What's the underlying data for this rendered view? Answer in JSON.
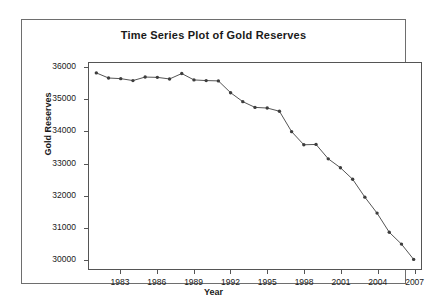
{
  "chart_data": {
    "type": "line",
    "title": "Time Series Plot of Gold Reserves",
    "xlabel": "Year",
    "ylabel": "Gold Reserves",
    "xlim": [
      1980.4,
      2007.6
    ],
    "ylim": [
      29700,
      36150
    ],
    "grid": false,
    "legend": "none",
    "marker": "filled-circle",
    "line_color": "#555555",
    "marker_color": "#3d3d3d",
    "xticks": [
      1983,
      1986,
      1989,
      1992,
      1995,
      1998,
      2001,
      2004,
      2007
    ],
    "xtick_labels": [
      "1983",
      "1986",
      "1989",
      "1992",
      "1995",
      "1998",
      "2001",
      "2004",
      "2007"
    ],
    "yticks": [
      30000,
      31000,
      32000,
      33000,
      34000,
      35000,
      36000
    ],
    "ytick_labels": [
      "30000",
      "31000",
      "32000",
      "33000",
      "34000",
      "35000",
      "36000"
    ],
    "x": [
      1981,
      1982,
      1983,
      1984,
      1985,
      1986,
      1987,
      1988,
      1989,
      1990,
      1991,
      1992,
      1993,
      1994,
      1995,
      1996,
      1997,
      1998,
      1999,
      2000,
      2001,
      2002,
      2003,
      2004,
      2005,
      2006,
      2007
    ],
    "values": [
      35840,
      35680,
      35660,
      35600,
      35710,
      35700,
      35650,
      35820,
      35620,
      35600,
      35590,
      35220,
      34940,
      34760,
      34740,
      34640,
      34000,
      33590,
      33600,
      33150,
      32870,
      32510,
      31950,
      31450,
      30850,
      30480,
      30000
    ],
    "series": [
      {
        "name": "Gold Reserves",
        "values": [
          35840,
          35680,
          35660,
          35600,
          35710,
          35700,
          35650,
          35820,
          35620,
          35600,
          35590,
          35220,
          34940,
          34760,
          34740,
          34640,
          34000,
          33590,
          33600,
          33150,
          32870,
          32510,
          31950,
          31450,
          30850,
          30480,
          30000
        ]
      }
    ]
  }
}
